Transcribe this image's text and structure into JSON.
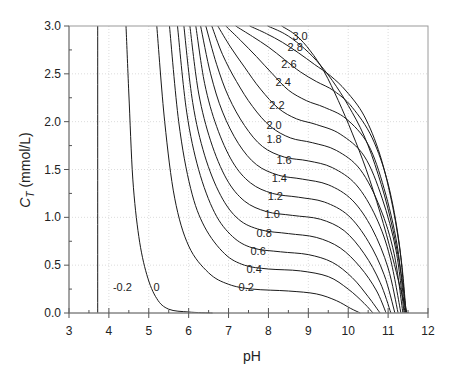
{
  "chart_data": {
    "type": "line",
    "subtype": "contour",
    "title": "",
    "xlabel": "pH",
    "ylabel": "C_T (mmol/L)",
    "ylabel_main": "C",
    "ylabel_sub": "T",
    "ylabel_rest": " (mmol/L)",
    "xlim": [
      3,
      12
    ],
    "ylim": [
      0,
      3.0
    ],
    "x_ticks": [
      3,
      4,
      5,
      6,
      7,
      8,
      9,
      10,
      11,
      12
    ],
    "x_tick_labels": [
      "3",
      "4",
      "5",
      "6",
      "7",
      "8",
      "9",
      "10",
      "11",
      "12"
    ],
    "y_ticks": [
      0.0,
      0.5,
      1.0,
      1.5,
      2.0,
      2.5,
      3.0
    ],
    "y_tick_labels": [
      "0.0",
      "0.5",
      "1.0",
      "1.5",
      "2.0",
      "2.5",
      "3.0"
    ],
    "grid": true,
    "legend": "none",
    "series": [
      {
        "name": "-0.2",
        "label_pos": [
          4.1,
          0.27
        ],
        "points": [
          [
            3.72,
            3.0
          ],
          [
            3.72,
            0.0
          ]
        ]
      },
      {
        "name": "0",
        "label_pos": [
          5.12,
          0.27
        ],
        "points": [
          [
            4.43,
            3.0
          ],
          [
            4.5,
            2.3
          ],
          [
            4.6,
            1.4
          ],
          [
            4.75,
            0.8
          ],
          [
            4.95,
            0.4
          ],
          [
            5.2,
            0.15
          ],
          [
            5.5,
            0.04
          ],
          [
            6.0,
            0.01
          ],
          [
            6.6,
            0.0
          ]
        ]
      },
      {
        "name": "0.2",
        "label_pos": [
          7.25,
          0.27
        ],
        "points": [
          [
            5.2,
            3.0
          ],
          [
            5.4,
            2.0
          ],
          [
            5.65,
            1.2
          ],
          [
            6.0,
            0.7
          ],
          [
            6.5,
            0.42
          ],
          [
            7.0,
            0.3
          ],
          [
            7.6,
            0.25
          ],
          [
            8.5,
            0.23
          ],
          [
            9.2,
            0.2
          ],
          [
            9.7,
            0.13
          ],
          [
            10.05,
            0.05
          ],
          [
            10.3,
            0.0
          ]
        ]
      },
      {
        "name": "0.4",
        "label_pos": [
          7.45,
          0.46
        ],
        "points": [
          [
            5.52,
            3.0
          ],
          [
            5.75,
            2.0
          ],
          [
            6.05,
            1.3
          ],
          [
            6.4,
            0.9
          ],
          [
            6.9,
            0.62
          ],
          [
            7.4,
            0.5
          ],
          [
            8.0,
            0.46
          ],
          [
            8.8,
            0.44
          ],
          [
            9.5,
            0.38
          ],
          [
            10.0,
            0.25
          ],
          [
            10.4,
            0.1
          ],
          [
            10.62,
            0.0
          ]
        ]
      },
      {
        "name": "0.6",
        "label_pos": [
          7.55,
          0.65
        ],
        "points": [
          [
            5.72,
            3.0
          ],
          [
            5.95,
            2.1
          ],
          [
            6.25,
            1.5
          ],
          [
            6.65,
            1.05
          ],
          [
            7.1,
            0.8
          ],
          [
            7.6,
            0.68
          ],
          [
            8.3,
            0.64
          ],
          [
            9.0,
            0.61
          ],
          [
            9.6,
            0.53
          ],
          [
            10.1,
            0.37
          ],
          [
            10.5,
            0.17
          ],
          [
            10.8,
            0.0
          ]
        ]
      },
      {
        "name": "0.8",
        "label_pos": [
          7.7,
          0.84
        ],
        "points": [
          [
            5.88,
            3.0
          ],
          [
            6.1,
            2.2
          ],
          [
            6.4,
            1.65
          ],
          [
            6.8,
            1.23
          ],
          [
            7.25,
            0.98
          ],
          [
            7.8,
            0.87
          ],
          [
            8.5,
            0.83
          ],
          [
            9.2,
            0.79
          ],
          [
            9.8,
            0.68
          ],
          [
            10.3,
            0.48
          ],
          [
            10.7,
            0.24
          ],
          [
            10.95,
            0.0
          ]
        ]
      },
      {
        "name": "1.0",
        "label_pos": [
          7.9,
          1.03
        ],
        "points": [
          [
            6.03,
            3.0
          ],
          [
            6.25,
            2.3
          ],
          [
            6.55,
            1.8
          ],
          [
            6.95,
            1.4
          ],
          [
            7.4,
            1.17
          ],
          [
            7.95,
            1.06
          ],
          [
            8.6,
            1.02
          ],
          [
            9.3,
            0.98
          ],
          [
            9.9,
            0.86
          ],
          [
            10.4,
            0.62
          ],
          [
            10.8,
            0.32
          ],
          [
            11.07,
            0.0
          ]
        ]
      },
      {
        "name": "1.2",
        "label_pos": [
          7.98,
          1.22
        ],
        "points": [
          [
            6.18,
            3.0
          ],
          [
            6.4,
            2.4
          ],
          [
            6.7,
            1.95
          ],
          [
            7.1,
            1.58
          ],
          [
            7.55,
            1.36
          ],
          [
            8.1,
            1.25
          ],
          [
            8.75,
            1.21
          ],
          [
            9.4,
            1.16
          ],
          [
            10.0,
            1.02
          ],
          [
            10.5,
            0.75
          ],
          [
            10.9,
            0.4
          ],
          [
            11.17,
            0.0
          ]
        ]
      },
      {
        "name": "1.4",
        "label_pos": [
          8.08,
          1.41
        ],
        "points": [
          [
            6.3,
            3.0
          ],
          [
            6.55,
            2.5
          ],
          [
            6.85,
            2.1
          ],
          [
            7.25,
            1.77
          ],
          [
            7.7,
            1.55
          ],
          [
            8.25,
            1.44
          ],
          [
            8.85,
            1.4
          ],
          [
            9.5,
            1.34
          ],
          [
            10.1,
            1.18
          ],
          [
            10.6,
            0.88
          ],
          [
            11.0,
            0.47
          ],
          [
            11.25,
            0.0
          ]
        ]
      },
      {
        "name": "1.6",
        "label_pos": [
          8.2,
          1.6
        ],
        "points": [
          [
            6.43,
            3.0
          ],
          [
            6.7,
            2.6
          ],
          [
            7.0,
            2.26
          ],
          [
            7.4,
            1.96
          ],
          [
            7.85,
            1.74
          ],
          [
            8.4,
            1.63
          ],
          [
            9.0,
            1.59
          ],
          [
            9.6,
            1.52
          ],
          [
            10.2,
            1.34
          ],
          [
            10.7,
            1.0
          ],
          [
            11.05,
            0.58
          ],
          [
            11.32,
            0.0
          ]
        ]
      },
      {
        "name": "1.8",
        "label_pos": [
          7.95,
          1.82
        ],
        "points": [
          [
            6.58,
            3.0
          ],
          [
            6.85,
            2.7
          ],
          [
            7.2,
            2.42
          ],
          [
            7.6,
            2.16
          ],
          [
            8.05,
            1.95
          ],
          [
            8.55,
            1.83
          ],
          [
            9.1,
            1.78
          ],
          [
            9.7,
            1.7
          ],
          [
            10.3,
            1.5
          ],
          [
            10.8,
            1.1
          ],
          [
            11.15,
            0.62
          ],
          [
            11.37,
            0.0
          ]
        ]
      },
      {
        "name": "2.0",
        "label_pos": [
          7.95,
          1.97
        ],
        "points": [
          [
            6.73,
            3.0
          ],
          [
            7.05,
            2.78
          ],
          [
            7.4,
            2.57
          ],
          [
            7.8,
            2.34
          ],
          [
            8.25,
            2.14
          ],
          [
            8.7,
            2.03
          ],
          [
            9.2,
            1.97
          ],
          [
            9.8,
            1.87
          ],
          [
            10.4,
            1.64
          ],
          [
            10.85,
            1.2
          ],
          [
            11.2,
            0.65
          ],
          [
            11.4,
            0.0
          ]
        ]
      },
      {
        "name": "2.2",
        "label_pos": [
          8.02,
          2.17
        ],
        "points": [
          [
            6.93,
            3.0
          ],
          [
            7.3,
            2.85
          ],
          [
            7.7,
            2.68
          ],
          [
            8.1,
            2.5
          ],
          [
            8.5,
            2.33
          ],
          [
            8.95,
            2.22
          ],
          [
            9.4,
            2.15
          ],
          [
            9.95,
            2.03
          ],
          [
            10.5,
            1.76
          ],
          [
            10.9,
            1.3
          ],
          [
            11.23,
            0.7
          ],
          [
            11.42,
            0.0
          ]
        ]
      },
      {
        "name": "2.4",
        "label_pos": [
          8.18,
          2.41
        ],
        "points": [
          [
            7.18,
            3.0
          ],
          [
            7.6,
            2.89
          ],
          [
            8.0,
            2.78
          ],
          [
            8.4,
            2.65
          ],
          [
            8.8,
            2.52
          ],
          [
            9.2,
            2.42
          ],
          [
            9.65,
            2.32
          ],
          [
            10.1,
            2.15
          ],
          [
            10.6,
            1.83
          ],
          [
            11.0,
            1.35
          ],
          [
            11.28,
            0.72
          ],
          [
            11.44,
            0.0
          ]
        ]
      },
      {
        "name": "2.6",
        "label_pos": [
          8.32,
          2.6
        ],
        "points": [
          [
            7.53,
            3.0
          ],
          [
            7.95,
            2.92
          ],
          [
            8.35,
            2.83
          ],
          [
            8.75,
            2.72
          ],
          [
            9.15,
            2.6
          ],
          [
            9.55,
            2.48
          ],
          [
            9.95,
            2.32
          ],
          [
            10.4,
            2.06
          ],
          [
            10.8,
            1.65
          ],
          [
            11.12,
            1.1
          ],
          [
            11.33,
            0.55
          ],
          [
            11.45,
            0.0
          ]
        ]
      },
      {
        "name": "2.8",
        "label_pos": [
          8.48,
          2.78
        ],
        "points": [
          [
            7.98,
            3.0
          ],
          [
            8.4,
            2.92
          ],
          [
            8.8,
            2.8
          ],
          [
            9.2,
            2.64
          ],
          [
            9.6,
            2.43
          ],
          [
            10.0,
            2.17
          ],
          [
            10.4,
            1.85
          ],
          [
            10.75,
            1.45
          ],
          [
            11.05,
            1.0
          ],
          [
            11.3,
            0.48
          ],
          [
            11.46,
            0.0
          ]
        ]
      },
      {
        "name": "3.0",
        "label_pos": [
          8.6,
          2.9
        ],
        "points": [
          [
            8.33,
            3.0
          ],
          [
            8.7,
            2.9
          ],
          [
            9.05,
            2.74
          ],
          [
            9.4,
            2.52
          ],
          [
            9.75,
            2.22
          ],
          [
            10.1,
            1.88
          ],
          [
            10.45,
            1.5
          ],
          [
            10.8,
            1.05
          ],
          [
            11.1,
            0.6
          ],
          [
            11.3,
            0.27
          ],
          [
            11.47,
            0.0
          ]
        ]
      }
    ]
  }
}
